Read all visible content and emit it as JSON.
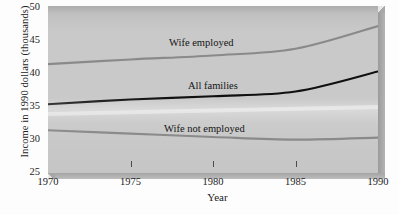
{
  "chart_data": {
    "type": "line",
    "title": "",
    "xlabel": "Year",
    "ylabel": "Income in 1990 dollars (thousands)",
    "xlim": [
      1970,
      1990
    ],
    "ylim": [
      25,
      50
    ],
    "xticks": [
      1970,
      1975,
      1980,
      1985,
      1990
    ],
    "yticks": [
      25,
      30,
      35,
      40,
      45,
      50
    ],
    "grid": false,
    "legend_position": "inline-annotations",
    "x": [
      1970,
      1975,
      1980,
      1985,
      1990
    ],
    "series": [
      {
        "name": "Wife employed",
        "values": [
          41.3,
          42.0,
          42.6,
          43.6,
          47.0
        ],
        "color": "#8a8a8a",
        "label": "Wife employed"
      },
      {
        "name": "All families",
        "values": [
          35.3,
          36.0,
          36.5,
          37.2,
          40.2
        ],
        "color": "#101010",
        "label": "All families"
      },
      {
        "name": "Wife not employed",
        "values": [
          31.4,
          30.9,
          30.4,
          30.0,
          30.3
        ],
        "color": "#8a8a8a",
        "label": "Wife not employed"
      }
    ],
    "annotations": [
      {
        "text": "Wife employed",
        "x": 1980.0,
        "y": 45.3
      },
      {
        "text": "All families",
        "x": 1982.2,
        "y": 38.9
      },
      {
        "text": "Wife not employed",
        "x": 1980.6,
        "y": 32.6
      }
    ],
    "panel_color": "#c9c9c9",
    "background_color": "#fdfdfd"
  },
  "axes": {
    "y_title": "Income in 1990 dollars (thousands)",
    "x_title": "Year",
    "y_tick_labels": [
      "50",
      "45",
      "40",
      "35",
      "30",
      "25"
    ],
    "x_tick_labels": [
      "1970",
      "1975",
      "1980",
      "1985",
      "1990"
    ]
  },
  "labels": {
    "wife_employed": "Wife employed",
    "all_families": "All families",
    "wife_not_employed": "Wife not employed"
  }
}
